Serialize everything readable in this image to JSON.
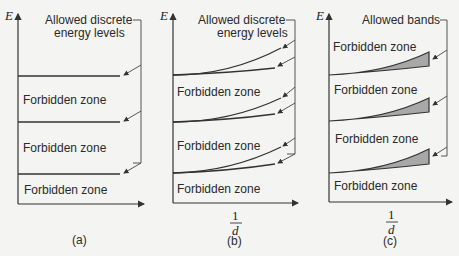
{
  "diagram": {
    "colors": {
      "line": "#333333",
      "band_fill": "#a8a8a8",
      "background": "#f4f4f2"
    },
    "panels": [
      {
        "id": "a",
        "caption": "(a)",
        "y_axis_label": "E",
        "x_axis_label": "",
        "bracket_label_line1": "Allowed discrete",
        "bracket_label_line2": "energy levels",
        "zones": [
          "Forbidden zone",
          "Forbidden zone",
          "Forbidden zone"
        ]
      },
      {
        "id": "b",
        "caption": "(b)",
        "y_axis_label": "E",
        "x_axis_label_num": "1",
        "x_axis_label_den": "d",
        "bracket_label_line1": "Allowed discrete",
        "bracket_label_line2": "energy levels",
        "zones": [
          "Forbidden zone",
          "Forbidden zone",
          "Forbidden zone"
        ]
      },
      {
        "id": "c",
        "caption": "(c)",
        "y_axis_label": "E",
        "x_axis_label_num": "1",
        "x_axis_label_den": "d",
        "bracket_label_line1": "Allowed bands",
        "zones": [
          "Forbidden zone",
          "Forbidden zone",
          "Forbidden zone",
          "Forbidden zone"
        ]
      }
    ]
  }
}
